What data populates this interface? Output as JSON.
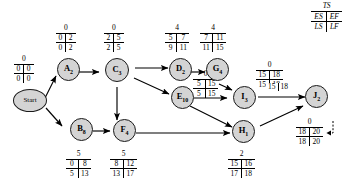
{
  "diagram": {
    "legend": {
      "ts": "TS",
      "es": "ES",
      "ef": "EF",
      "ls": "LS",
      "lf": "LF"
    },
    "nodes": [
      {
        "id": "start",
        "label": "Start",
        "sub": "",
        "ts": "0",
        "es": "0",
        "ef": "0",
        "ls": "0",
        "lf": "0"
      },
      {
        "id": "A",
        "label": "A",
        "sub": "2",
        "ts": "0",
        "es": "0",
        "ef": "2",
        "ls": "0",
        "lf": "2"
      },
      {
        "id": "B",
        "label": "B",
        "sub": "8",
        "ts": "5",
        "es": "0",
        "ef": "8",
        "ls": "5",
        "lf": "13"
      },
      {
        "id": "C",
        "label": "C",
        "sub": "3",
        "ts": "0",
        "es": "2",
        "ef": "5",
        "ls": "2",
        "lf": "5"
      },
      {
        "id": "D",
        "label": "D",
        "sub": "2",
        "ts": "4",
        "es": "5",
        "ef": "7",
        "ls": "9",
        "lf": "11"
      },
      {
        "id": "E",
        "label": "E",
        "sub": "10",
        "ts": "0",
        "es": "5",
        "ef": "15",
        "ls": "5",
        "lf": "15"
      },
      {
        "id": "F",
        "label": "F",
        "sub": "4",
        "ts": "5",
        "es": "8",
        "ef": "12",
        "ls": "13",
        "lf": "17"
      },
      {
        "id": "G",
        "label": "G",
        "sub": "4",
        "ts": "4",
        "es": "7",
        "ef": "11",
        "ls": "11",
        "lf": "15"
      },
      {
        "id": "H",
        "label": "H",
        "sub": "1",
        "ts": "2",
        "es": "15",
        "ef": "16",
        "ls": "17",
        "lf": "18"
      },
      {
        "id": "I",
        "label": "I",
        "sub": "3",
        "ts": "0",
        "es": "15",
        "ef": "18",
        "ls": "15",
        "lf": "18"
      },
      {
        "id": "J",
        "label": "J",
        "sub": "2",
        "ts": "0",
        "es": "18",
        "ef": "20",
        "ls": "18",
        "lf": "20"
      }
    ],
    "edge_labels": [
      {
        "id": "dg",
        "ts": "0",
        "es": "5",
        "ef": "15"
      },
      {
        "id": "ij",
        "ts": "",
        "es": "15",
        "ef": "18"
      }
    ]
  }
}
